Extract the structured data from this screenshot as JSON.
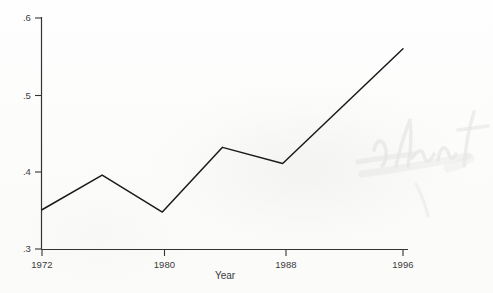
{
  "chart_data": {
    "type": "line",
    "title": "",
    "subtitle": "",
    "xlabel": "Year",
    "ylabel": "",
    "x": [
      1972,
      1976,
      1980,
      1984,
      1988,
      1996
    ],
    "values": [
      0.351,
      0.396,
      0.348,
      0.432,
      0.411,
      0.56
    ],
    "series": [
      {
        "name": "series-1",
        "x": [
          1972,
          1976,
          1980,
          1984,
          1988,
          1996
        ],
        "values": [
          0.351,
          0.396,
          0.348,
          0.432,
          0.411,
          0.56
        ]
      }
    ],
    "xlim": [
      1972,
      1996
    ],
    "ylim": [
      0.3,
      0.6
    ],
    "xticks": [
      1972,
      1980,
      1988,
      1996
    ],
    "xtick_labels": [
      "1972",
      "1980",
      "1988",
      "1996"
    ],
    "yticks": [
      0.3,
      0.4,
      0.5,
      0.6
    ],
    "ytick_labels": [
      ".3",
      ".4",
      ".5",
      ".6"
    ],
    "grid": false,
    "legend": false,
    "legend_position": "none",
    "line_color": "#1a1a1a",
    "axis_color": "#333333",
    "background_color": "#fdfdfd",
    "annotations": []
  },
  "axes": {
    "y_tick_labels": [
      {
        "label": ".6",
        "value": 0.6
      },
      {
        "label": ".5",
        "value": 0.5
      },
      {
        "label": ".4",
        "value": 0.4
      },
      {
        "label": ".3",
        "value": 0.3
      }
    ],
    "x_tick_labels": [
      {
        "label": "1972",
        "value": 1972
      },
      {
        "label": "1980",
        "value": 1980
      },
      {
        "label": "1988",
        "value": 1988
      },
      {
        "label": "1996",
        "value": 1996
      }
    ],
    "x_axis_title": "Year"
  },
  "watermark": {
    "text": "Islent"
  }
}
